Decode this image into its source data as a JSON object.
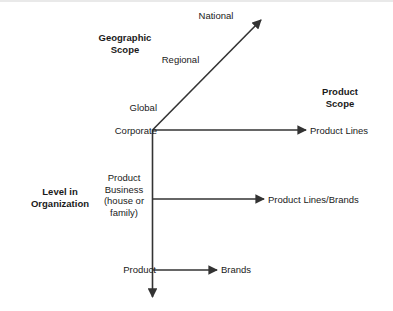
{
  "diagram": {
    "title_axes": {
      "geographic_scope": "Geographic\nScope",
      "product_scope": "Product\nScope",
      "level_in_organization": "Level in\nOrganization"
    },
    "geographic_axis": {
      "name": "geographic-scope-axis",
      "direction": "diagonal-up-right",
      "ticks": [
        {
          "label": "National"
        },
        {
          "label": "Regional"
        },
        {
          "label": "Global"
        }
      ]
    },
    "organization_axis": {
      "name": "level-in-organization-axis",
      "direction": "vertical-down",
      "levels": [
        {
          "label": "Corporate"
        },
        {
          "label": "Product\nBusiness\n(house or\nfamily)"
        },
        {
          "label": "Product"
        }
      ]
    },
    "product_axis": {
      "name": "product-scope-axis",
      "direction": "horizontal-right",
      "rows": [
        {
          "label": "Product Lines"
        },
        {
          "label": "Product Lines/Brands"
        },
        {
          "label": "Brands"
        }
      ]
    },
    "colors": {
      "line": "#333333",
      "text": "#1a1a1a",
      "background": "#ffffff",
      "top_edge": "#e9e9e9"
    }
  }
}
